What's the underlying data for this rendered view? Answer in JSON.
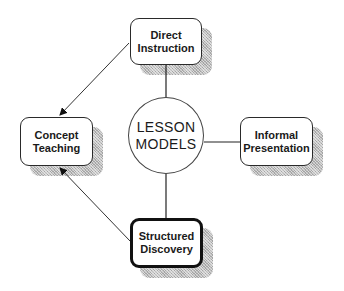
{
  "center": {
    "line1": "LESSON",
    "line2": "MODELS"
  },
  "nodes": [
    {
      "id": "direct-instruction",
      "line1": "Direct",
      "line2": "Instruction"
    },
    {
      "id": "concept-teaching",
      "line1": "Concept",
      "line2": "Teaching"
    },
    {
      "id": "informal-presentation",
      "line1": "Informal",
      "line2": "Presentation"
    },
    {
      "id": "structured-discovery",
      "line1": "Structured",
      "line2": "Discovery",
      "emphasized": true
    }
  ],
  "edges": [
    {
      "from": "lesson-models",
      "to": "direct-instruction",
      "type": "line"
    },
    {
      "from": "lesson-models",
      "to": "informal-presentation",
      "type": "line"
    },
    {
      "from": "lesson-models",
      "to": "structured-discovery",
      "type": "line"
    },
    {
      "from": "direct-instruction",
      "to": "concept-teaching",
      "type": "arrow"
    },
    {
      "from": "structured-discovery",
      "to": "concept-teaching",
      "type": "arrow"
    }
  ]
}
